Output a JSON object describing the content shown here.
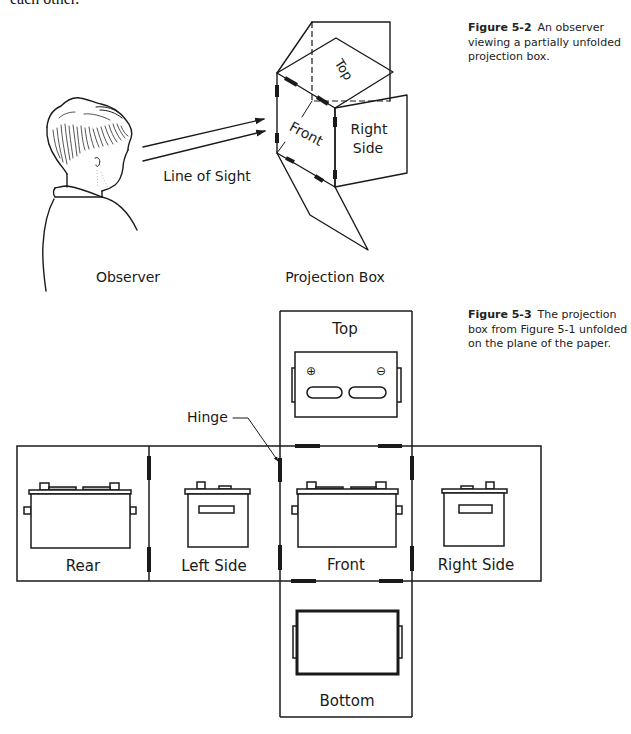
{
  "page": {
    "top_text": "each other."
  },
  "figure_5_2": {
    "caption": {
      "label": "Figure 5-2",
      "lines": [
        "An observer",
        "viewing a partially unfolded",
        "projection box."
      ]
    },
    "labels": {
      "line_of_sight": "Line of Sight",
      "observer": "Observer",
      "projection_box": "Projection Box",
      "top": "Top",
      "front": "Front",
      "right": "Right",
      "side": "Side"
    }
  },
  "figure_5_3": {
    "caption": {
      "label": "Figure 5-3",
      "lines": [
        "The projection",
        "box from Figure 5-1 unfolded",
        "on the plane of the paper."
      ]
    },
    "labels": {
      "hinge": "Hinge",
      "top": "Top",
      "rear": "Rear",
      "left_side": "Left Side",
      "front": "Front",
      "right_side": "Right Side",
      "bottom": "Bottom"
    },
    "symbols": {
      "positive_terminal": "⊕",
      "negative_terminal": "⊖"
    }
  }
}
